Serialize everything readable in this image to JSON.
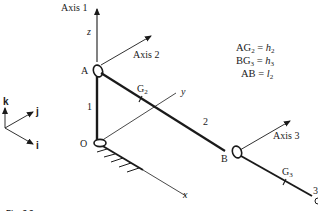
{
  "diagram": {
    "colors": {
      "ink": "#1a1a1a",
      "background": "#ffffff"
    },
    "axes_labels": {
      "axis1": "Axis 1",
      "axis2": "Axis 2",
      "axis3": "Axis 3"
    },
    "coordinate_labels": {
      "z": "z",
      "y": "y",
      "x": "x"
    },
    "points": {
      "A": "A",
      "B": "B",
      "O": "O",
      "G2": "G",
      "G2_sub": "2",
      "G3": "G",
      "G3_sub": "3"
    },
    "links": {
      "link1": "1",
      "link2": "2",
      "link3": "3"
    },
    "unit_vectors": {
      "k": "k",
      "j": "j",
      "i": "i"
    },
    "equations": [
      {
        "lhs": "AG",
        "lhs_sub": "2",
        "eq": " = ",
        "rhs": "h",
        "rhs_sub": "2"
      },
      {
        "lhs": "BG",
        "lhs_sub": "3",
        "eq": " = ",
        "rhs": "h",
        "rhs_sub": "3"
      },
      {
        "lhs": "AB",
        "lhs_sub": "",
        "eq": " = ",
        "rhs": "l",
        "rhs_sub": "2"
      }
    ],
    "caption": "Fig. 3.3"
  }
}
